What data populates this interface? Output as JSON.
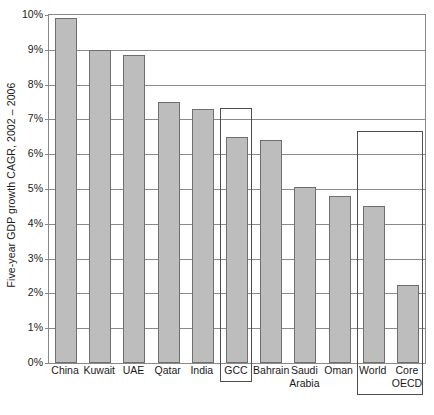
{
  "chart_data": {
    "type": "bar",
    "title": "",
    "subtitle": "",
    "xlabel": "",
    "ylabel": "Five-year GDP growth CAGR, 2002 – 2006",
    "ylim": [
      0,
      10
    ],
    "y_tick_labels": [
      "0%",
      "1%",
      "2%",
      "3%",
      "4%",
      "5%",
      "6%",
      "7%",
      "8%",
      "9%",
      "10%"
    ],
    "y_tick_values": [
      0,
      1,
      2,
      3,
      4,
      5,
      6,
      7,
      8,
      9,
      10
    ],
    "grid": true,
    "legend": "none",
    "categories": [
      "China",
      "Kuwait",
      "UAE",
      "Qatar",
      "India",
      "GCC",
      "Bahrain",
      "Saudi Arabia",
      "Oman",
      "World",
      "Core OECD"
    ],
    "values": [
      9.9,
      9.0,
      8.85,
      7.5,
      7.3,
      6.5,
      6.4,
      5.05,
      4.8,
      4.5,
      2.25
    ],
    "value_unit": "%",
    "annotations": [
      {
        "label": "GCC",
        "type": "highlight-box",
        "covers": [
          "GCC"
        ],
        "top_value": 7.3
      },
      {
        "label": "World / Core OECD",
        "type": "highlight-box",
        "covers": [
          "World",
          "Core OECD"
        ],
        "top_value": 6.65
      }
    ]
  },
  "axis": {
    "y_title": "Five-year GDP growth CAGR, 2002 – 2006",
    "ticks": [
      {
        "label": "10%",
        "value": 10
      },
      {
        "label": "9%",
        "value": 9
      },
      {
        "label": "8%",
        "value": 8
      },
      {
        "label": "7%",
        "value": 7
      },
      {
        "label": "6%",
        "value": 6
      },
      {
        "label": "5%",
        "value": 5
      },
      {
        "label": "4%",
        "value": 4
      },
      {
        "label": "3%",
        "value": 3
      },
      {
        "label": "2%",
        "value": 2
      },
      {
        "label": "1%",
        "value": 1
      },
      {
        "label": "0%",
        "value": 0
      }
    ]
  },
  "x_labels": [
    {
      "line1": "China",
      "line2": ""
    },
    {
      "line1": "Kuwait",
      "line2": ""
    },
    {
      "line1": "UAE",
      "line2": ""
    },
    {
      "line1": "Qatar",
      "line2": ""
    },
    {
      "line1": "India",
      "line2": ""
    },
    {
      "line1": "GCC",
      "line2": ""
    },
    {
      "line1": "Bahrain",
      "line2": ""
    },
    {
      "line1": "Saudi",
      "line2": "Arabia"
    },
    {
      "line1": "Oman",
      "line2": ""
    },
    {
      "line1": "World",
      "line2": ""
    },
    {
      "line1": "Core",
      "line2": "OECD"
    }
  ],
  "style": {
    "bar_fill": "#bdbdbd",
    "bar_stroke": "#6f6f6f",
    "grid_color": "#8a8a8a",
    "box_color": "#4d4d4d",
    "text_color": "#1a1a1a",
    "background": "#ffffff"
  }
}
